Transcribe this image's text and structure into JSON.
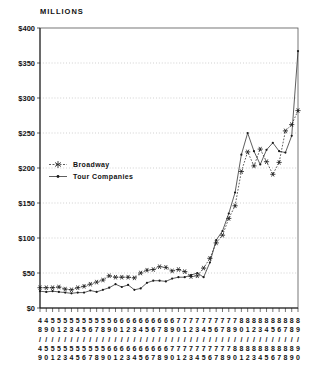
{
  "chart_data": {
    "type": "line",
    "title": "MILLIONS",
    "xlabel": "",
    "ylabel": "MILLIONS",
    "ylim": [
      0,
      400
    ],
    "y_ticks": [
      0,
      50,
      100,
      150,
      200,
      250,
      300,
      350,
      400
    ],
    "y_tick_labels": [
      "$0",
      "$50",
      "$100",
      "$150",
      "$200",
      "$250",
      "$300",
      "$350",
      "$400"
    ],
    "grid": "dotted-horizontal",
    "legend_position": "inside-middle-left",
    "categories": [
      "48/49",
      "49/50",
      "50/51",
      "51/52",
      "52/53",
      "53/54",
      "54/55",
      "55/56",
      "56/57",
      "57/58",
      "58/59",
      "59/60",
      "60/61",
      "61/62",
      "62/63",
      "63/64",
      "64/65",
      "65/66",
      "66/67",
      "67/68",
      "68/69",
      "69/70",
      "70/71",
      "71/72",
      "72/73",
      "73/74",
      "74/75",
      "75/76",
      "76/77",
      "77/78",
      "78/79",
      "79/80",
      "80/81",
      "81/82",
      "82/83",
      "83/84",
      "84/85",
      "85/86",
      "86/87",
      "87/88",
      "88/89",
      "89/90"
    ],
    "series": [
      {
        "name": "Broadway",
        "marker": "asterisk",
        "line_style": "dotted",
        "values": [
          29,
          29,
          29,
          30,
          27,
          26,
          29,
          31,
          34,
          37,
          40,
          46,
          44,
          44,
          44,
          43,
          50,
          54,
          55,
          59,
          58,
          53,
          55,
          52,
          45,
          46,
          57,
          71,
          93,
          104,
          128,
          146,
          195,
          223,
          203,
          227,
          209,
          191,
          208,
          253,
          262,
          282
        ]
      },
      {
        "name": "Tour Companies",
        "marker": "dot",
        "line_style": "solid",
        "values": [
          24,
          23,
          24,
          23,
          22,
          21,
          22,
          22,
          25,
          23,
          26,
          29,
          34,
          30,
          33,
          26,
          28,
          36,
          39,
          39,
          38,
          42,
          44,
          44,
          47,
          50,
          44,
          65,
          97,
          110,
          135,
          165,
          219,
          250,
          224,
          205,
          226,
          236,
          224,
          222,
          246,
          367
        ]
      }
    ]
  },
  "colors": {
    "background": "#ffffff",
    "line": "#1a1a1a",
    "text": "#111111",
    "grid": "#aaaaaa",
    "frame": "#555555"
  }
}
